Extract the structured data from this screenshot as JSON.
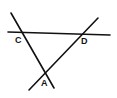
{
  "diagram": {
    "lines": [
      {
        "name": "line-cd",
        "x1": 8,
        "y1": 32,
        "x2": 110,
        "y2": 35
      },
      {
        "name": "line-ca",
        "x1": 11,
        "y1": 13,
        "x2": 54,
        "y2": 88
      },
      {
        "name": "line-da",
        "x1": 29,
        "y1": 90,
        "x2": 98,
        "y2": 18
      }
    ],
    "points": [
      {
        "label": "C",
        "x": 15,
        "y": 43
      },
      {
        "label": "D",
        "x": 81,
        "y": 44
      },
      {
        "label": "A",
        "x": 41,
        "y": 86
      }
    ],
    "color": "#111111"
  }
}
